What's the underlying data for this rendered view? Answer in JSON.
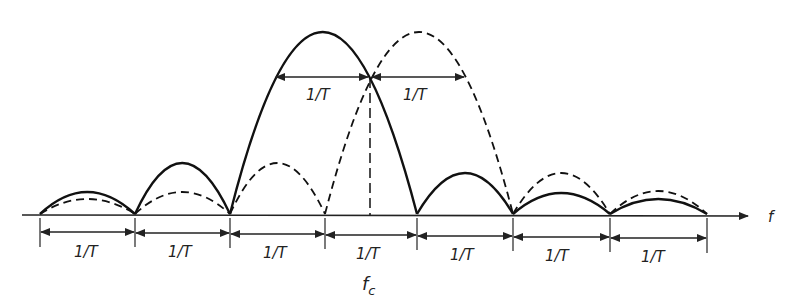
{
  "figure": {
    "axis_label": "f",
    "center_label": "f",
    "center_sub": "c",
    "interval_label": "1/T",
    "bottom_intervals": [
      "1/T",
      "1/T",
      "1/T",
      "1/T",
      "1/T",
      "1/T",
      "1/T"
    ],
    "top_intervals": [
      "1/T",
      "1/T"
    ],
    "series": [
      {
        "name": "solid spectrum",
        "style": "solid"
      },
      {
        "name": "dashed spectrum (shifted by 1/T)",
        "style": "dashed"
      }
    ]
  }
}
